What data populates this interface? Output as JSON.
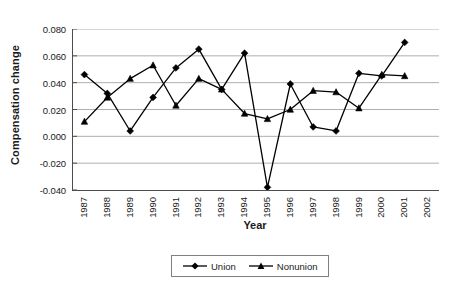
{
  "chart_data": {
    "type": "line",
    "title": "",
    "xlabel": "Year",
    "ylabel": "Compensation change",
    "categories": [
      "1987",
      "1988",
      "1989",
      "1990",
      "1991",
      "1992",
      "1993",
      "1994",
      "1995",
      "1996",
      "1997",
      "1998",
      "1999",
      "2000",
      "2001",
      "2002"
    ],
    "x_tick_labels": [
      "1987",
      "1988",
      "1989",
      "1990",
      "1991",
      "1992",
      "1993",
      "1994",
      "1995",
      "1996",
      "1997",
      "1998",
      "1999",
      "2000",
      "2001",
      "2002"
    ],
    "y_tick_labels": [
      "0.080",
      "0.060",
      "0.040",
      "0.020",
      "0.000",
      "-0.020",
      "-0.040"
    ],
    "y_ticks": [
      0.08,
      0.06,
      0.04,
      0.02,
      0.0,
      -0.02,
      -0.04
    ],
    "ylim": [
      -0.04,
      0.08
    ],
    "grid": "horizontal",
    "legend_position": "bottom",
    "series": [
      {
        "name": "Union",
        "marker": "diamond",
        "color": "#000000",
        "x": [
          "1987",
          "1988",
          "1989",
          "1990",
          "1991",
          "1992",
          "1993",
          "1994",
          "1995",
          "1996",
          "1997",
          "1998",
          "1999",
          "2000",
          "2001"
        ],
        "values": [
          0.046,
          0.032,
          0.004,
          0.029,
          0.051,
          0.065,
          0.035,
          0.062,
          -0.038,
          0.039,
          0.007,
          0.004,
          0.047,
          0.045,
          0.07
        ]
      },
      {
        "name": "Nonunion",
        "marker": "triangle",
        "color": "#000000",
        "x": [
          "1987",
          "1988",
          "1989",
          "1990",
          "1991",
          "1992",
          "1993",
          "1994",
          "1995",
          "1996",
          "1997",
          "1998",
          "1999",
          "2000",
          "2001"
        ],
        "values": [
          0.011,
          0.029,
          0.043,
          0.053,
          0.023,
          0.043,
          0.035,
          0.017,
          0.013,
          0.02,
          0.034,
          0.033,
          0.021,
          0.046,
          0.045
        ]
      }
    ]
  },
  "legend": {
    "entries": [
      {
        "label": "Union"
      },
      {
        "label": "Nonunion"
      }
    ]
  },
  "axes": {
    "x_title": "Year",
    "y_title": "Compensation change"
  },
  "colors": {
    "series": "#000000",
    "grid": "#a6a6a6",
    "axis": "#4d4d4d",
    "background": "#ffffff"
  }
}
